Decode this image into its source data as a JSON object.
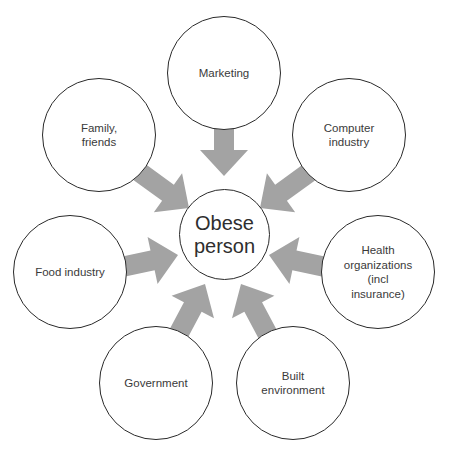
{
  "diagram": {
    "center": {
      "label": "Obese\nperson"
    },
    "nodes": [
      {
        "id": "marketing",
        "label": "Marketing"
      },
      {
        "id": "family-friends",
        "label": "Family,\nfriends"
      },
      {
        "id": "computer-industry",
        "label": "Computer\nindustry"
      },
      {
        "id": "food-industry",
        "label": "Food industry"
      },
      {
        "id": "health-organizations",
        "label": "Health\norganizations\n(incl\ninsurance)"
      },
      {
        "id": "government",
        "label": "Government"
      },
      {
        "id": "built-environment",
        "label": "Built\nenvironment"
      }
    ],
    "colors": {
      "arrow": "#a3a3a3",
      "circle_stroke": "#2a2a2a",
      "text": "#3a3a3a"
    }
  }
}
